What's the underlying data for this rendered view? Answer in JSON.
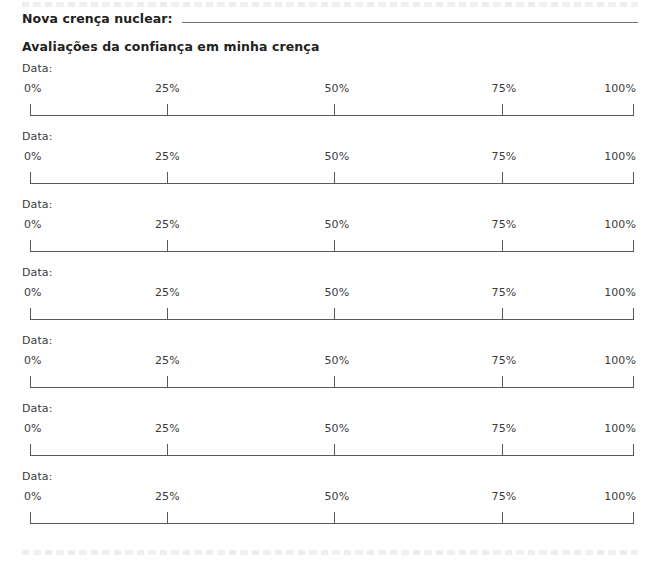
{
  "page": {
    "language": "pt-BR",
    "background_color": "#ffffff",
    "text_color": "#231f20",
    "rule_color": "#58595b"
  },
  "header": {
    "belief_label": "Nova crença nuclear:",
    "belief_value": "",
    "belief_placeholder": "",
    "section_heading": "Avaliações da confiança em minha crença"
  },
  "scale": {
    "date_label": "Data:",
    "tick_labels": [
      "0%",
      "25%",
      "50%",
      "75%",
      "100%"
    ],
    "tick_values": [
      0,
      25,
      50,
      75,
      100
    ]
  },
  "rows": [
    {
      "date_label": "Data:",
      "date_value": "",
      "rating_value": ""
    },
    {
      "date_label": "Data:",
      "date_value": "",
      "rating_value": ""
    },
    {
      "date_label": "Data:",
      "date_value": "",
      "rating_value": ""
    },
    {
      "date_label": "Data:",
      "date_value": "",
      "rating_value": ""
    },
    {
      "date_label": "Data:",
      "date_value": "",
      "rating_value": ""
    },
    {
      "date_label": "Data:",
      "date_value": "",
      "rating_value": ""
    },
    {
      "date_label": "Data:",
      "date_value": "",
      "rating_value": ""
    }
  ]
}
